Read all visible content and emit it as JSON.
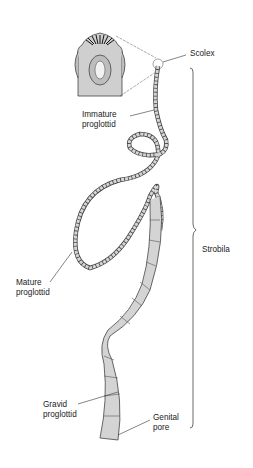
{
  "diagram": {
    "labels": {
      "scolex": "Scolex",
      "immature_line1": "Immature",
      "immature_line2": "proglottid",
      "strobila": "Strobila",
      "mature_line1": "Mature",
      "mature_line2": "proglottid",
      "gravid_line1": "Gravid",
      "gravid_line2": "proglottid",
      "genital_line1": "Genital",
      "genital_line2": "pore"
    },
    "colors": {
      "body_fill": "#d4d4d4",
      "outline": "#333333",
      "text": "#222222"
    }
  }
}
